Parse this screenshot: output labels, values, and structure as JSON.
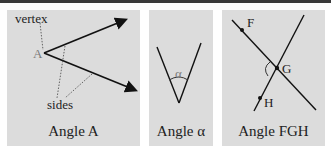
{
  "panels": [
    {
      "caption": "Angle A",
      "labels": {
        "vertex": "vertex",
        "point": "A",
        "sides": "sides"
      }
    },
    {
      "caption": "Angle α",
      "labels": {
        "angle": "α"
      }
    },
    {
      "caption": "Angle FGH",
      "labels": {
        "f": "F",
        "g": "G",
        "h": "H"
      }
    }
  ],
  "colors": {
    "panel_bg": "#dcdcdc",
    "line": "#111111",
    "topbar": "#3a3a3a"
  }
}
